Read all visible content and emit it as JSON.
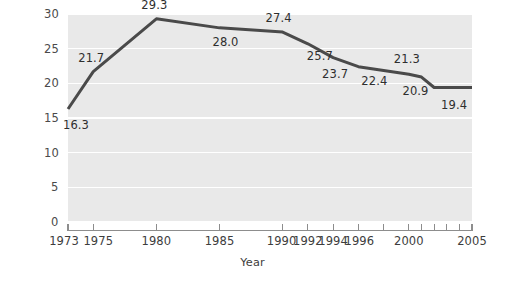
{
  "chart_data": {
    "type": "line",
    "title": "",
    "xlabel": "Year",
    "ylabel": "Abortions per 1,000 women aged 15–44",
    "xlim": [
      1973,
      2005
    ],
    "ylim": [
      0,
      30
    ],
    "grid": true,
    "legend": null,
    "y_ticks": [
      0,
      5,
      10,
      15,
      20,
      25,
      30
    ],
    "y_tick_labels": [
      "0",
      "5",
      "10",
      "15",
      "20",
      "25",
      "30"
    ],
    "x_ticks": [
      1973,
      1975,
      1980,
      1985,
      1990,
      1992,
      1994,
      1996,
      2000,
      2005
    ],
    "x_tick_labels": [
      "1973",
      "1975",
      "1980",
      "1985",
      "1990",
      "1992",
      "1994",
      "1996",
      "2000",
      "2005"
    ],
    "x_minor_ticks": [
      1998,
      2001,
      2002,
      2003,
      2004
    ],
    "line_color": "#4a4a4a",
    "plot_background": "#e9e9e9",
    "gridline_color": "#ffffff",
    "x": [
      1973,
      1975,
      1980,
      1985,
      1990,
      1992,
      1994,
      1996,
      2000,
      2001,
      2002,
      2005
    ],
    "values": [
      16.3,
      21.7,
      29.3,
      28.0,
      27.4,
      25.7,
      23.7,
      22.4,
      21.3,
      20.9,
      19.4,
      19.4
    ],
    "point_labels": [
      {
        "year": 1973,
        "value": 16.3,
        "text": "16.3"
      },
      {
        "year": 1975,
        "value": 21.7,
        "text": "21.7"
      },
      {
        "year": 1980,
        "value": 29.3,
        "text": "29.3"
      },
      {
        "year": 1985,
        "value": 28.0,
        "text": "28.0"
      },
      {
        "year": 1990,
        "value": 27.4,
        "text": "27.4"
      },
      {
        "year": 1992,
        "value": 25.7,
        "text": "25.7"
      },
      {
        "year": 1994,
        "value": 23.7,
        "text": "23.7"
      },
      {
        "year": 1996,
        "value": 22.4,
        "text": "22.4"
      },
      {
        "year": 2000,
        "value": 21.3,
        "text": "21.3"
      },
      {
        "year": 2001,
        "value": 20.9,
        "text": "20.9"
      },
      {
        "year": 2002,
        "value": 19.4,
        "text": "19.4"
      }
    ]
  }
}
